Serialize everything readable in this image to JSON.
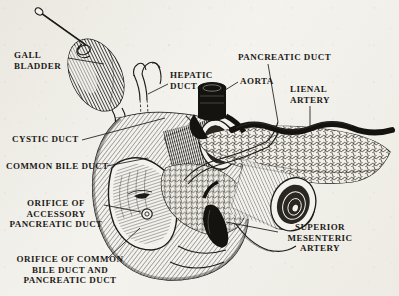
{
  "figure": {
    "medium": "engraving",
    "background_color": "#f3f2ed",
    "ink_color": "#1d1b18",
    "width": 399,
    "height": 296
  },
  "labels": [
    {
      "id": "gall-bladder",
      "text": "GALL\nBLADDER",
      "x": 10,
      "y": 52,
      "align": "left",
      "leader": [
        [
          68,
          58
        ],
        [
          104,
          64
        ]
      ]
    },
    {
      "id": "hepatic-duct",
      "text": "HEPATIC\nDUCT",
      "x": 170,
      "y": 72,
      "align": "left",
      "leader": [
        [
          168,
          84
        ],
        [
          148,
          94
        ]
      ]
    },
    {
      "id": "pancreatic-duct",
      "text": "PANCREATIC DUCT",
      "x": 238,
      "y": 54,
      "align": "left",
      "leader": [
        [
          268,
          64
        ],
        [
          278,
          122
        ]
      ]
    },
    {
      "id": "aorta",
      "text": "AORTA",
      "x": 238,
      "y": 78,
      "align": "left",
      "leader": [
        [
          238,
          82
        ],
        [
          222,
          92
        ]
      ]
    },
    {
      "id": "lienal-artery",
      "text": "LIENAL\nARTERY",
      "x": 290,
      "y": 86,
      "align": "left",
      "leader": [
        [
          310,
          106
        ],
        [
          310,
          126
        ]
      ]
    },
    {
      "id": "cystic-duct",
      "text": "CYSTIC DUCT",
      "x": 12,
      "y": 138,
      "align": "left",
      "leader": [
        [
          82,
          140
        ],
        [
          165,
          118
        ]
      ]
    },
    {
      "id": "common-bile-duct",
      "text": "COMMON BILE DUCT",
      "x": 6,
      "y": 165,
      "align": "left",
      "leader": [
        [
          107,
          166
        ],
        [
          148,
          158
        ]
      ]
    },
    {
      "id": "orifice-accessory",
      "text": "ORIFICE OF\nACCESSORY\nPANCREATIC DUCT",
      "x": 22,
      "y": 200,
      "align": "center",
      "leader": [
        [
          104,
          205
        ],
        [
          140,
          196
        ]
      ]
    },
    {
      "id": "orifice-common-bile",
      "text": "ORIFICE OF COMMON\nBILE DUCT AND\nPANCREATIC DUCT",
      "x": 8,
      "y": 258,
      "align": "center",
      "leader": [
        [
          108,
          258
        ],
        [
          138,
          228
        ]
      ]
    },
    {
      "id": "superior-mesenteric",
      "text": "SUPERIOR\nMESENTERIC\nARTERY",
      "x": 282,
      "y": 226,
      "align": "center",
      "leader": [
        [
          278,
          232
        ],
        [
          228,
          222
        ]
      ]
    }
  ],
  "structures": [
    {
      "id": "gall-bladder",
      "name": "Gall bladder",
      "shading": "fine parallel hatching"
    },
    {
      "id": "cystic-duct",
      "name": "Cystic duct",
      "shading": "outlined tube"
    },
    {
      "id": "hepatic-duct",
      "name": "Hepatic duct",
      "shading": "outlined forked tube"
    },
    {
      "id": "common-bile-duct",
      "name": "Common bile duct",
      "shading": "outlined tube"
    },
    {
      "id": "duodenum",
      "name": "Duodenum (opened)",
      "shading": "cross hatching, mucosal folds"
    },
    {
      "id": "orifice-accessory-duct",
      "name": "Orifice of accessory pancreatic duct",
      "shading": "small ring"
    },
    {
      "id": "orifice-common-duct",
      "name": "Orifice of common bile duct and pancreatic duct",
      "shading": "slit"
    },
    {
      "id": "pancreas",
      "name": "Pancreas",
      "shading": "lobular stipple"
    },
    {
      "id": "pancreatic-duct",
      "name": "Pancreatic duct",
      "shading": "thin outlined channel"
    },
    {
      "id": "aorta",
      "name": "Aorta",
      "shading": "solid black stump"
    },
    {
      "id": "lienal-artery",
      "name": "Lienal artery",
      "shading": "solid black vessel"
    },
    {
      "id": "superior-mesenteric-artery",
      "name": "Superior mesenteric artery",
      "shading": "solid black vessel"
    },
    {
      "id": "stomach-stump",
      "name": "Stomach / pyloric stump",
      "shading": "ringed lumen hatching"
    },
    {
      "id": "jejunum-stump",
      "name": "Jejunum stump",
      "shading": "ringed lumen hatching"
    }
  ]
}
